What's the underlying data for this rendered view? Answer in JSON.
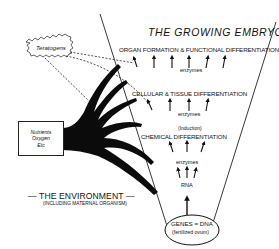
{
  "title": "THE GROWING EMBRYO",
  "levels": {
    "organ": {
      "label": "ORGAN FORMATION & FUNCTIONAL DIFFERENTIATION",
      "enzymes": "enzymes"
    },
    "cellular": {
      "label": "CELLULAR & TISSUE DIFFERENTIATION",
      "enzymes": "enzymes"
    },
    "chemical": {
      "note": "(Induction)",
      "label": "CHEMICAL DIFFERENTIATION"
    },
    "enzymes_mid": "enzymes",
    "rna": "RNA",
    "genes": {
      "label": "GENES = DNA",
      "sub": "(fertilized ovum)"
    }
  },
  "teratogens": {
    "label": "Teratogens"
  },
  "inputs_box": {
    "lines": [
      "Nutrients",
      "Oxygen",
      "Etc"
    ]
  },
  "environment": {
    "label": "— THE ENVIRONMENT —",
    "sub": "(INCLUDING MATERNAL ORGANISM)"
  }
}
